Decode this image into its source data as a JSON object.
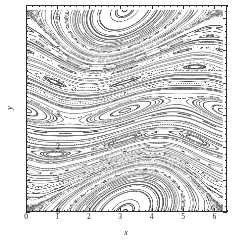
{
  "chart_data": {
    "type": "scatter",
    "title": "",
    "subtitle": "",
    "xlabel": "x",
    "ylabel": "y",
    "xlim": [
      0,
      6.4
    ],
    "ylim": [
      0,
      6.4
    ],
    "xticks": [
      0,
      1,
      2,
      3,
      4,
      5,
      6
    ],
    "xticklabels": [
      "0",
      "1",
      "2",
      "3",
      "4",
      "5",
      "6"
    ],
    "yticks": [
      0,
      1,
      2,
      3,
      4,
      5,
      6
    ],
    "yticklabels": [
      "0",
      "1",
      "2",
      "3",
      "4",
      "5",
      "6"
    ],
    "minor_tick_step": 0.2,
    "grid": false,
    "legend": null,
    "annotations": [],
    "marker": {
      "shape": "dot",
      "size_px": 0.85,
      "color": "#333333"
    },
    "background_color": "#ffffff",
    "frame_color": "#2b2b2b",
    "map": {
      "name": "standard-map-sheared",
      "K": 0.62,
      "shear": 1.0,
      "iterations_per_orbit": 900,
      "orbit_count": 150,
      "period": 6.283185307179586
    },
    "seeds": [
      [
        0.12,
        0.08
      ],
      [
        0.3,
        0.55
      ],
      [
        0.48,
        1.1
      ],
      [
        0.66,
        1.62
      ],
      [
        0.84,
        2.15
      ],
      [
        1.02,
        2.7
      ],
      [
        1.2,
        3.25
      ],
      [
        1.38,
        3.78
      ],
      [
        1.56,
        4.3
      ],
      [
        1.74,
        4.85
      ],
      [
        1.92,
        5.4
      ],
      [
        2.1,
        5.95
      ],
      [
        2.28,
        0.35
      ],
      [
        2.46,
        0.9
      ],
      [
        2.64,
        1.45
      ],
      [
        2.82,
        2.0
      ],
      [
        3.0,
        2.52
      ],
      [
        3.18,
        3.05
      ],
      [
        3.36,
        3.6
      ],
      [
        3.54,
        4.15
      ],
      [
        3.72,
        4.68
      ],
      [
        3.9,
        5.2
      ],
      [
        4.08,
        5.75
      ],
      [
        4.26,
        0.18
      ],
      [
        4.44,
        0.72
      ],
      [
        4.62,
        1.28
      ],
      [
        4.8,
        1.82
      ],
      [
        4.98,
        2.36
      ],
      [
        5.16,
        2.9
      ],
      [
        5.34,
        3.44
      ],
      [
        5.52,
        3.98
      ],
      [
        5.7,
        4.52
      ],
      [
        5.88,
        5.06
      ],
      [
        6.06,
        5.6
      ],
      [
        6.24,
        6.14
      ],
      [
        0.55,
        5.05
      ],
      [
        0.7,
        4.95
      ],
      [
        0.4,
        5.18
      ],
      [
        0.9,
        5.38
      ],
      [
        1.05,
        5.55
      ],
      [
        4.55,
        5.55
      ],
      [
        4.7,
        5.35
      ],
      [
        4.4,
        5.7
      ],
      [
        4.95,
        5.2
      ],
      [
        5.1,
        5.05
      ],
      [
        4.85,
        2.55
      ],
      [
        5.0,
        2.4
      ],
      [
        5.2,
        2.25
      ],
      [
        4.7,
        2.7
      ],
      [
        5.35,
        2.1
      ],
      [
        2.7,
        4.05
      ],
      [
        2.85,
        3.95
      ],
      [
        2.55,
        4.18
      ],
      [
        3.0,
        3.82
      ],
      [
        3.15,
        3.7
      ],
      [
        0.25,
        2.85
      ],
      [
        0.6,
        2.45
      ],
      [
        1.0,
        2.05
      ],
      [
        1.45,
        1.62
      ],
      [
        1.85,
        1.2
      ],
      [
        2.3,
        0.8
      ],
      [
        2.75,
        0.4
      ],
      [
        3.2,
        0.05
      ],
      [
        0.15,
        1.35
      ],
      [
        0.5,
        0.95
      ],
      [
        3.6,
        5.95
      ],
      [
        3.95,
        5.55
      ],
      [
        4.3,
        5.15
      ],
      [
        2.05,
        6.1
      ],
      [
        1.6,
        6.2
      ],
      [
        5.6,
        1.05
      ],
      [
        5.9,
        0.65
      ],
      [
        6.15,
        0.3
      ],
      [
        5.3,
        1.45
      ],
      [
        5.05,
        1.85
      ],
      [
        0.05,
        6.05
      ],
      [
        0.35,
        6.2
      ],
      [
        1.2,
        0.15
      ],
      [
        1.75,
        0.25
      ],
      [
        2.2,
        2.95
      ],
      [
        3.45,
        1.55
      ],
      [
        3.8,
        1.15
      ],
      [
        4.15,
        0.75
      ],
      [
        4.5,
        0.35
      ],
      [
        3.1,
        1.95
      ],
      [
        2.6,
        5.45
      ],
      [
        2.95,
        5.05
      ],
      [
        3.3,
        4.65
      ],
      [
        3.65,
        4.25
      ],
      [
        4.0,
        3.85
      ],
      [
        4.35,
        3.45
      ],
      [
        4.65,
        3.1
      ],
      [
        5.45,
        4.9
      ],
      [
        5.75,
        4.5
      ],
      [
        6.05,
        4.1
      ],
      [
        0.8,
        3.7
      ],
      [
        1.15,
        3.3
      ],
      [
        1.5,
        2.9
      ],
      [
        1.9,
        2.5
      ],
      [
        2.25,
        2.1
      ],
      [
        0.2,
        4.4
      ],
      [
        0.55,
        4.0
      ],
      [
        0.95,
        3.55
      ],
      [
        1.35,
        4.8
      ],
      [
        1.7,
        4.4
      ],
      [
        2.05,
        3.98
      ],
      [
        2.4,
        3.55
      ],
      [
        5.2,
        6.05
      ],
      [
        5.55,
        5.7
      ],
      [
        5.85,
        5.3
      ],
      [
        0.45,
        0.45
      ],
      [
        0.85,
        0.6
      ],
      [
        1.3,
        0.95
      ],
      [
        2.9,
        6.15
      ],
      [
        3.35,
        6.05
      ],
      [
        6.1,
        2.75
      ],
      [
        5.8,
        3.15
      ],
      [
        5.5,
        3.55
      ],
      [
        0.1,
        3.15
      ],
      [
        0.65,
        1.75
      ],
      [
        1.95,
        5.75
      ],
      [
        2.35,
        5.3
      ],
      [
        3.75,
        2.85
      ],
      [
        4.1,
        2.45
      ],
      [
        4.45,
        2.05
      ],
      [
        1.1,
        1.15
      ],
      [
        1.55,
        0.55
      ],
      [
        2.5,
        1.75
      ],
      [
        2.8,
        1.35
      ],
      [
        3.25,
        2.75
      ],
      [
        4.9,
        4.25
      ],
      [
        5.25,
        3.85
      ],
      [
        0.95,
        6.0
      ],
      [
        1.4,
        5.85
      ],
      [
        6.2,
        1.65
      ],
      [
        3.5,
        3.2
      ],
      [
        3.85,
        0.95
      ],
      [
        4.2,
        4.6
      ],
      [
        4.55,
        4.2
      ],
      [
        0.75,
        2.2
      ],
      [
        2.15,
        1.05
      ],
      [
        2.45,
        2.65
      ],
      [
        5.65,
        2.35
      ],
      [
        5.95,
        1.95
      ],
      [
        6.25,
        3.45
      ],
      [
        1.25,
        2.6
      ],
      [
        1.65,
        3.05
      ],
      [
        3.05,
        0.6
      ],
      [
        3.4,
        0.2
      ],
      [
        4.75,
        0.95
      ]
    ]
  },
  "axes": {
    "x_title": "x",
    "y_title": "y"
  }
}
